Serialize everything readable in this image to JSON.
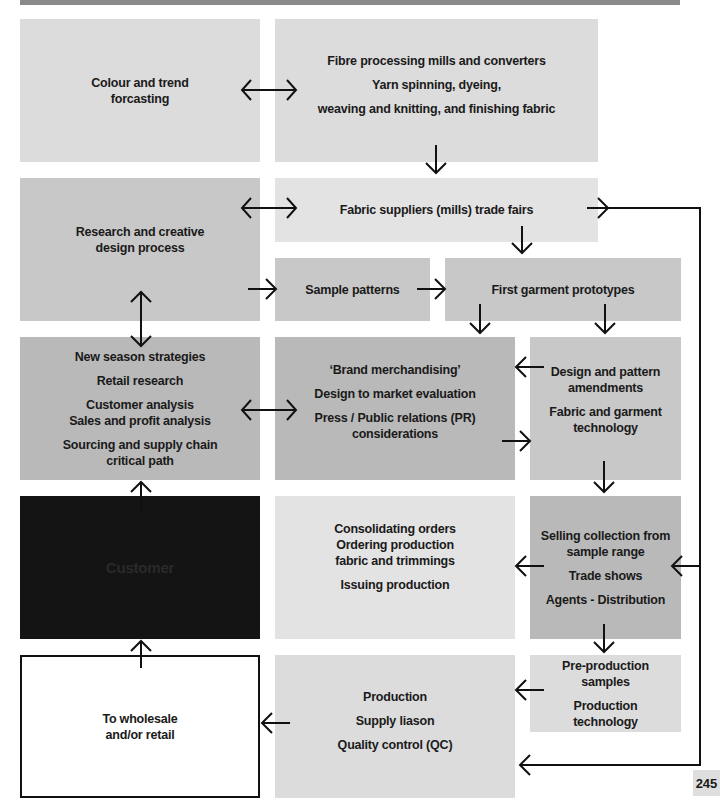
{
  "diagram": {
    "boxes": {
      "colour_trend": {
        "lines": [
          "Colour and trend",
          "forcasting"
        ]
      },
      "fibre_processing": {
        "lines": [
          "Fibre processing mills and converters",
          "Yarn spinning, dyeing,",
          "weaving and knitting, and finishing fabric"
        ]
      },
      "research_design": {
        "lines": [
          "Research and creative",
          "design process"
        ]
      },
      "fabric_suppliers": {
        "lines": [
          "Fabric suppliers (mills) trade fairs"
        ]
      },
      "sample_patterns": {
        "lines": [
          "Sample patterns"
        ]
      },
      "first_prototypes": {
        "lines": [
          "First garment prototypes"
        ]
      },
      "strategies": {
        "lines": [
          "New season strategies",
          "Retail research",
          "Customer analysis",
          "Sales and profit analysis",
          "Sourcing and supply chain",
          "critical path"
        ]
      },
      "brand_merch": {
        "lines": [
          "‘Brand merchandising’",
          "Design to market evaluation",
          "Press / Public relations (PR)",
          "considerations"
        ]
      },
      "design_amend": {
        "lines": [
          "Design and pattern",
          "amendments",
          "Fabric and garment",
          "technology"
        ]
      },
      "customer": {
        "lines": [
          "Customer"
        ]
      },
      "consolidating": {
        "lines": [
          "Consolidating orders",
          "Ordering production",
          "fabric and trimmings",
          "Issuing production"
        ]
      },
      "selling": {
        "lines": [
          "Selling collection from",
          "sample range",
          "Trade shows",
          "Agents - Distribution"
        ]
      },
      "wholesale": {
        "lines": [
          "To wholesale",
          "and/or retail"
        ]
      },
      "production": {
        "lines": [
          "Production",
          "Supply liason",
          "Quality control (QC)"
        ]
      },
      "preproduction": {
        "lines": [
          "Pre-production",
          "samples",
          "Production",
          "technology"
        ]
      }
    },
    "colors": {
      "light": "#dcdcdc",
      "mid": "#c8c8c8",
      "dark": "#b9b9b9",
      "black": "#141414",
      "line": "#111111"
    }
  },
  "page": {
    "number": "245"
  }
}
